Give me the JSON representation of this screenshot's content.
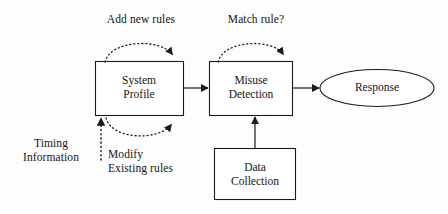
{
  "diagram": {
    "background_color": "#fdfdfd",
    "stroke_color": "#1a1a1a",
    "nodes": [
      {
        "id": "system-profile",
        "shape": "rectangle",
        "label_line1": "System",
        "label_line2": "Profile"
      },
      {
        "id": "misuse-detection",
        "shape": "rectangle",
        "label_line1": "Misuse",
        "label_line2": "Detection"
      },
      {
        "id": "response",
        "shape": "ellipse",
        "label_line1": "Response"
      },
      {
        "id": "data-collection",
        "shape": "rectangle",
        "label_line1": "Data",
        "label_line2": "Collection"
      }
    ],
    "annotations": [
      {
        "id": "add-new-rules",
        "text": "Add new rules",
        "style": "dotted-arc"
      },
      {
        "id": "match-rule",
        "text": "Match rule?",
        "style": "dotted-arc"
      },
      {
        "id": "modify-existing-rules",
        "line1": "Modify",
        "line2": "Existing rules",
        "style": "dotted-arc"
      },
      {
        "id": "timing-information",
        "line1": "Timing",
        "line2": "Information",
        "style": "dotted-arrow"
      }
    ],
    "edges": [
      {
        "id": "profile-to-misuse",
        "style": "solid-arrow"
      },
      {
        "id": "misuse-to-response",
        "style": "solid-arrow"
      },
      {
        "id": "collection-to-misuse",
        "style": "solid-arrow"
      }
    ]
  }
}
